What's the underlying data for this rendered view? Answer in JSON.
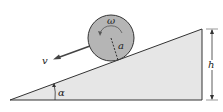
{
  "diagram": {
    "labels": {
      "omega": "ω",
      "radius": "a",
      "velocity": "v",
      "height": "h",
      "angle": "α"
    },
    "colors": {
      "incline_fill": "#e6e6e6",
      "disk_fill": "#b5b5b5",
      "stroke": "#333333"
    }
  }
}
